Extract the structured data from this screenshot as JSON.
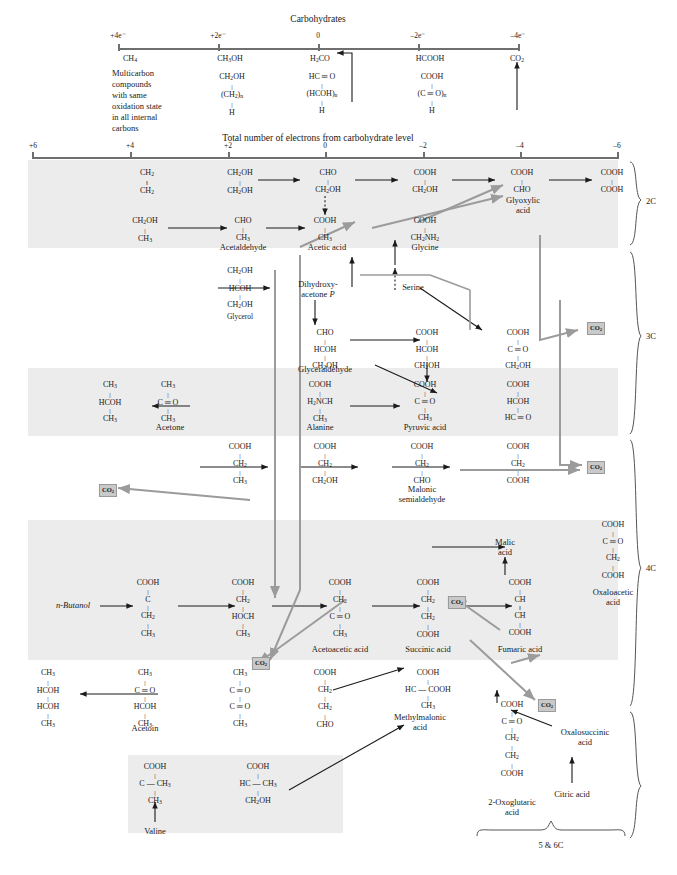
{
  "figure": {
    "top_scale": {
      "title": "Carbohydrates",
      "ticks": [
        "+4e⁻",
        "+2e⁻",
        "0",
        "–2e⁻",
        "–4e⁻"
      ],
      "compounds": [
        "CH₄",
        "CH₃OH",
        "H₂CO",
        "HCOOH",
        "CO₂"
      ],
      "note_lines": [
        "Multicarbon",
        "compounds",
        "with same",
        "oxidation state",
        "in all internal",
        "carbons"
      ],
      "generic": [
        {
          "l1": "CH₂OH",
          "l2": "(CH₂)ₙ",
          "l3": "H"
        },
        {
          "l1": "HC ═ O",
          "l2": "(HCOH)ₙ",
          "l3": "H"
        },
        {
          "l1": "COOH",
          "l2": "(C ═ O)ₙ",
          "l3": "H"
        }
      ]
    },
    "main_scale": {
      "title": "Total number of electrons from carbohydrate level",
      "ticks": [
        "+6",
        "+4",
        "+2",
        "0",
        "–2",
        "–4",
        "–6"
      ]
    },
    "braces": [
      {
        "label": "2C"
      },
      {
        "label": "3C"
      },
      {
        "label": "4C"
      },
      {
        "label": "5 & 6C"
      }
    ],
    "co2_labels": [
      "CO₂",
      "CO₂",
      "CO₂",
      "CO₂",
      "CO₂",
      "CO₂"
    ],
    "molecules": [
      {
        "id": "ethylene",
        "lines": [
          "CH₂",
          "‖",
          "CH₂"
        ]
      },
      {
        "id": "ethylene-glycol",
        "lines": [
          "CH₂OH",
          "|",
          "CH₂OH"
        ]
      },
      {
        "id": "glycolaldehyde",
        "lines": [
          "CHO",
          "|",
          "CH₂OH"
        ]
      },
      {
        "id": "glycolic-acid",
        "lines": [
          "COOH",
          "|",
          "CH₂OH"
        ]
      },
      {
        "id": "glyoxylic-acid",
        "lines": [
          "COOH",
          "|",
          "CHO"
        ]
      },
      {
        "id": "oxalic-acid",
        "lines": [
          "COOH",
          "|",
          "COOH"
        ]
      },
      {
        "id": "ethanol",
        "lines": [
          "CH₂OH",
          "|",
          "CH₃"
        ]
      },
      {
        "id": "acetaldehyde",
        "lines": [
          "CHO",
          "|",
          "CH₃"
        ]
      },
      {
        "id": "acetic-acid",
        "lines": [
          "COOH",
          "|",
          "CH₃"
        ]
      },
      {
        "id": "glycine",
        "lines": [
          "COOH",
          "|",
          "CH₂NH₂"
        ]
      },
      {
        "id": "glycerol",
        "lines": [
          "CH₂OH",
          "|",
          "HCOH",
          "|",
          "CH₂OH"
        ]
      },
      {
        "id": "glyceraldehyde",
        "lines": [
          "CHO",
          "|",
          "HCOH",
          "|",
          "CH₂OH"
        ]
      },
      {
        "id": "glyceric-acid",
        "lines": [
          "COOH",
          "|",
          "HCOH",
          "|",
          "CH₂OH"
        ]
      },
      {
        "id": "hydroxypyruvic",
        "lines": [
          "COOH",
          "|",
          "C ═ O",
          "|",
          "CH₂OH"
        ]
      },
      {
        "id": "isopropanol",
        "lines": [
          "CH₃",
          "|",
          "HCOH",
          "|",
          "CH₃"
        ]
      },
      {
        "id": "acetone",
        "lines": [
          "CH₃",
          "|",
          "C ═ O",
          "|",
          "CH₃"
        ]
      },
      {
        "id": "alanine",
        "lines": [
          "COOH",
          "|",
          "H₂NCH",
          "|",
          "CH₃"
        ]
      },
      {
        "id": "pyruvic-acid",
        "lines": [
          "COOH",
          "|",
          "C ═ O",
          "|",
          "CH₃"
        ]
      },
      {
        "id": "tartronic-semi",
        "lines": [
          "COOH",
          "|",
          "HCOH",
          "|",
          "HC ═ O"
        ]
      },
      {
        "id": "propionic-acid",
        "lines": [
          "COOH",
          "|",
          "CH₂",
          "|",
          "CH₃"
        ]
      },
      {
        "id": "hydroxypropionic",
        "lines": [
          "COOH",
          "|",
          "CH₂",
          "|",
          "CH₂OH"
        ]
      },
      {
        "id": "malonic-semi",
        "lines": [
          "COOH",
          "|",
          "CH₂",
          "|",
          "CHO"
        ]
      },
      {
        "id": "malonic-acid",
        "lines": [
          "COOH",
          "|",
          "CH₂",
          "|",
          "COOH"
        ]
      },
      {
        "id": "butyric-acid",
        "lines": [
          "COOH",
          "|",
          "C",
          "|",
          "CH₂",
          "|",
          "CH₃"
        ]
      },
      {
        "id": "hydroxybutyric",
        "lines": [
          "COOH",
          "|",
          "CH₂",
          "|",
          "HOCH",
          "|",
          "CH₃"
        ]
      },
      {
        "id": "acetoacetic-acid",
        "lines": [
          "COOH",
          "|",
          "CH₂",
          "|",
          "C ═ O",
          "|",
          "CH₃"
        ]
      },
      {
        "id": "succinic-acid",
        "lines": [
          "COOH",
          "|",
          "CH₂",
          "|",
          "CH₂",
          "|",
          "COOH"
        ]
      },
      {
        "id": "fumaric-acid",
        "lines": [
          "COOH",
          "|",
          "CH",
          "‖",
          "CH",
          "|",
          "COOH"
        ]
      },
      {
        "id": "oxaloacetic-acid",
        "lines": [
          "COOH",
          "|",
          "C ═ O",
          "|",
          "CH₂",
          "|",
          "COOH"
        ]
      },
      {
        "id": "butanediol",
        "lines": [
          "CH₃",
          "|",
          "HCOH",
          "|",
          "HCOH",
          "|",
          "CH₃"
        ]
      },
      {
        "id": "acetoin",
        "lines": [
          "CH₃",
          "|",
          "C ═ O",
          "|",
          "HCOH",
          "|",
          "CH₃"
        ]
      },
      {
        "id": "diacetyl",
        "lines": [
          "CH₃",
          "|",
          "C ═ O",
          "|",
          "C ═ O",
          "|",
          "CH₃"
        ]
      },
      {
        "id": "succinic-semi",
        "lines": [
          "COOH",
          "|",
          "CH₂",
          "|",
          "CH₂",
          "|",
          "CHO"
        ]
      },
      {
        "id": "methylmalonic",
        "lines": [
          "COOH",
          "|",
          "HC — COOH",
          "|",
          "CH₃"
        ]
      },
      {
        "id": "oxoglutaric",
        "lines": [
          "COOH",
          "|",
          "C ═ O",
          "|",
          "CH₂",
          "|",
          "CH₂",
          "|",
          "COOH"
        ]
      },
      {
        "id": "valine-keto",
        "lines": [
          "COOH",
          "|",
          "C  — CH₃",
          "|",
          "CH₃"
        ]
      },
      {
        "id": "valine-hydroxy",
        "lines": [
          "COOH",
          "|",
          "HC — CH₃",
          "|",
          "CH₂OH"
        ]
      }
    ],
    "names": {
      "acetaldehyde": "Acetaldehyde",
      "acetic_acid": "Acetic acid",
      "glyoxylic_acid": "Glyoxylic\nacid",
      "glycine": "Glycine",
      "glycerol": "Glycerol",
      "dhap": "Dihydroxy-\nacetone P",
      "glyceraldehyde": "Glyceraldehyde",
      "serine": "Serine",
      "acetone": "Acetone",
      "alanine": "Alanine",
      "pyruvic_acid": "Pyruvic acid",
      "malonic_semialdehyde": "Malonic\nsemialdehyde",
      "n_butanol": "n-Butanol",
      "acetoacetic_acid": "Acetoacetic acid",
      "succinic_acid": "Succinic acid",
      "fumaric_acid": "Fumaric acid",
      "malic_acid": "Malic\nacid",
      "oxaloacetic_acid": "Oxaloacetic\nacid",
      "acetoin": "Acetoin",
      "methylmalonic_acid": "Methylmalonic\nacid",
      "oxoglutaric_acid": "2-Oxoglutaric\nacid",
      "oxalosuccinic_acid": "Oxalosuccinic\nacid",
      "citric_acid": "Citric acid",
      "valine": "Valine"
    },
    "colors": {
      "band_fill": "#ececec",
      "gray_arrow": "#9b9b9b",
      "black_arrow": "#1a1a1a",
      "scale_line": "#6f6f6f",
      "co2_bg": "#c9c9c9",
      "text": "#1a1a1a"
    }
  }
}
